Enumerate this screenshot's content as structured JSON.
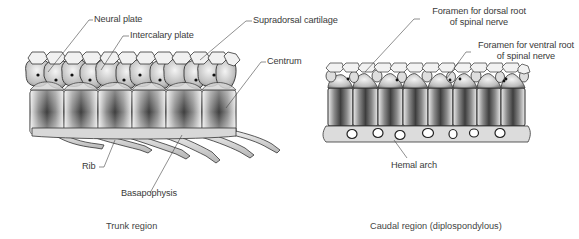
{
  "figure": {
    "panels": [
      {
        "id": "trunk",
        "caption": "Trunk region",
        "labels": {
          "neural_plate": "Neural plate",
          "intercalary_plate": "Intercalary plate",
          "supradorsal_cartilage": "Supradorsal cartilage",
          "centrum": "Centrum",
          "rib": "Rib",
          "basapophysis": "Basapophysis"
        },
        "vertebra_count": 6
      },
      {
        "id": "caudal",
        "caption": "Caudal region (diplospondylous)",
        "labels": {
          "foramen_dorsal_line1": "Foramen for dorsal root",
          "foramen_dorsal_line2": "of spinal nerve",
          "foramen_ventral_line1": "Foramen for ventral root",
          "foramen_ventral_line2": "of spinal nerve",
          "hemal_arch": "Hemal arch"
        },
        "vertebra_count": 8
      }
    ],
    "colors": {
      "bone_light": "#e6e6e6",
      "bone_mid": "#9a9a9a",
      "bone_dark": "#3c3c3c",
      "outline": "#2a2a2a",
      "text": "#3a3a3a"
    }
  }
}
